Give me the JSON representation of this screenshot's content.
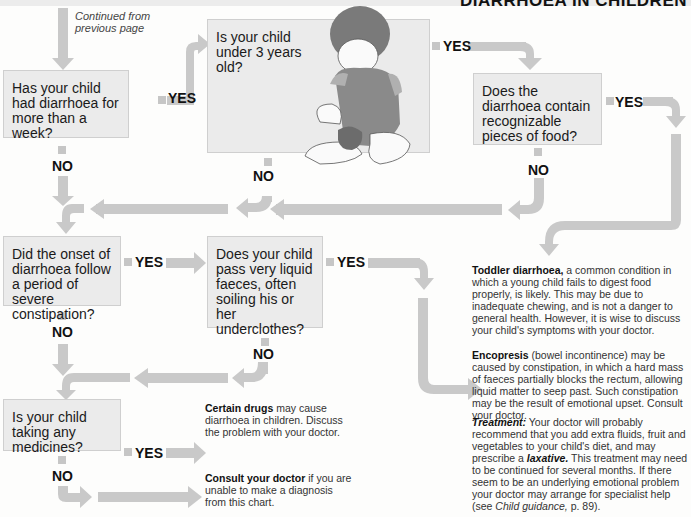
{
  "header": {
    "title": "DIARRHOEA IN CHILDREN"
  },
  "continued_note": "Continued from previous page",
  "questions": [
    {
      "id": "q1",
      "text": "Has your child had diarrhoea for more than a week?"
    },
    {
      "id": "q2",
      "text": "Is your child under 3 years old?"
    },
    {
      "id": "q3",
      "text": "Does the diarrhoea contain recognizable pieces of food?"
    },
    {
      "id": "q4",
      "text": "Did the onset of diarrhoea follow a period of severe constipation?"
    },
    {
      "id": "q5",
      "text": "Does your child pass very liquid faeces, often soiling his or her underclothes?"
    },
    {
      "id": "q6",
      "text": "Is your child taking any medicines?"
    }
  ],
  "labels": {
    "yes": "YES",
    "no": "NO"
  },
  "outcomes": {
    "toddler": {
      "title": "Toddler diarrhoea,",
      "body": " a common condition in which a young child fails to digest food properly, is likely. This may be due to inadequate chewing, and is not a danger to general health. However, it is wise to discuss your child's symptoms with your doctor."
    },
    "encopresis": {
      "title": "Encopresis",
      "body": " (bowel incontinence) may be caused by constipation, in which a hard mass of faeces partially blocks the rectum, allowing liquid matter to seep past. Such constipation may be the result of emotional upset. Consult your doctor."
    },
    "treatment": {
      "title": "Treatment:",
      "body1": " Your doctor will probably recommend that you add extra fluids, fruit and vegetables to your child's diet, and may prescribe a ",
      "laxative": "laxative.",
      "body2": " This treatment may need to be continued for several months. If there seem to be an underlying emotional problem your doctor may arrange for specialist help (see ",
      "ref": "Child guidance,",
      "body3": " p. 89)."
    },
    "drugs": {
      "title": "Certain drugs",
      "body": " may cause diarrhoea in children. Discuss the problem with your doctor."
    },
    "consult": {
      "title": "Consult your doctor",
      "body": " if you are unable to make a diagnosis from this chart."
    }
  },
  "colors": {
    "box_fill": "#ebebeb",
    "arrow": "#c9c9c9",
    "text": "#1a1a1a"
  }
}
